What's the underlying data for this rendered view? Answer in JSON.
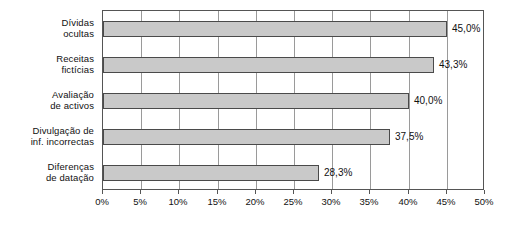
{
  "chart_data": {
    "type": "bar",
    "orientation": "horizontal",
    "title": "",
    "xlabel": "",
    "ylabel": "",
    "xlim": [
      0,
      50
    ],
    "xtick_step": 5,
    "grid": true,
    "legend": false,
    "value_suffix": "%",
    "decimal_separator": ",",
    "categories": [
      "Dívidas\nocultas",
      "Receitas\nfictícias",
      "Avaliação\nde activos",
      "Divulgação de\ninf. incorrectas",
      "Diferenças\nde datação"
    ],
    "category_lines": [
      [
        "Dívidas",
        "ocultas"
      ],
      [
        "Receitas",
        "fictícias"
      ],
      [
        "Avaliação",
        "de activos"
      ],
      [
        "Divulgação de",
        "inf. incorrectas"
      ],
      [
        "Diferenças",
        "de datação"
      ]
    ],
    "values": [
      45.0,
      43.3,
      40.0,
      37.5,
      28.3
    ],
    "value_labels": [
      "45,0%",
      "43,3%",
      "40,0%",
      "37,5%",
      "28,3%"
    ],
    "xtick_labels": [
      "0%",
      "5%",
      "10%",
      "15%",
      "20%",
      "25%",
      "30%",
      "35%",
      "40%",
      "45%",
      "50%"
    ],
    "xtick_values": [
      0,
      5,
      10,
      15,
      20,
      25,
      30,
      35,
      40,
      45,
      50
    ],
    "colors": {
      "bar_fill": "#c9c9c9",
      "bar_border": "#4a4a4a",
      "gridline": "#9a9a9a",
      "frame": "#555555",
      "text": "#111111",
      "background": "#ffffff"
    }
  }
}
